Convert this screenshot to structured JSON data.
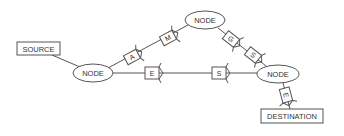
{
  "diagram": {
    "type": "network-routing",
    "source": {
      "label": "SOURCE"
    },
    "destination": {
      "label": "DESTINATION"
    },
    "nodes": [
      {
        "id": "left",
        "label": "NODE"
      },
      {
        "id": "top",
        "label": "NODE"
      },
      {
        "id": "right",
        "label": "NODE"
      }
    ],
    "packets": {
      "upper_path": [
        "A",
        "M",
        "G",
        "S"
      ],
      "lower_path": [
        "E",
        "S"
      ],
      "final_hop": [
        "E"
      ]
    },
    "colors": {
      "stroke": "#555555",
      "text": "#333333",
      "background": "#ffffff"
    }
  }
}
